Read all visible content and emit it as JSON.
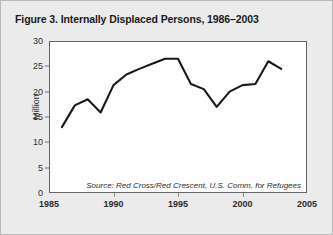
{
  "figure": {
    "title": "Figure 3. Internally Displaced Persons, 1986–2003",
    "source_note": "Source: Red Cross/Red Crescent, U.S. Comm. for Refugees",
    "line_color": "#1a1a1a",
    "frame_color": "#666666",
    "background": "#ebebeb",
    "plot_background": "#ffffff"
  },
  "chart_data": {
    "type": "line",
    "title": "Figure 3. Internally Displaced Persons, 1986–2003",
    "xlabel": "",
    "ylabel": "Million",
    "xlim": [
      1985,
      2005
    ],
    "ylim": [
      0,
      30
    ],
    "xticks": [
      1985,
      1990,
      1995,
      2000,
      2005
    ],
    "yticks": [
      0,
      5,
      10,
      15,
      20,
      25,
      30
    ],
    "grid": false,
    "legend": "none",
    "annotations": [
      "Source: Red Cross/Red Crescent, U.S. Comm. for Refugees"
    ],
    "x": [
      1986,
      1987,
      1988,
      1989,
      1990,
      1991,
      1992,
      1993,
      1994,
      1995,
      1996,
      1997,
      1998,
      1999,
      2000,
      2001,
      2002,
      2003
    ],
    "values": [
      13.0,
      17.3,
      18.5,
      15.9,
      21.3,
      23.4,
      24.5,
      25.5,
      26.5,
      26.5,
      21.5,
      20.5,
      17.0,
      20.0,
      21.3,
      21.5,
      26.0,
      24.5
    ]
  }
}
